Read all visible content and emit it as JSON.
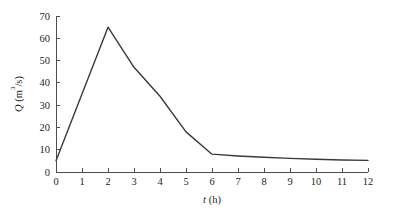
{
  "figure": {
    "background_color": "#ffffff",
    "line_color": "#3a3a3a",
    "axis_color": "#4d4d4d",
    "text_color": "#231f20"
  },
  "axes": {
    "x_title_var": "t",
    "x_title_unit": " (h)",
    "y_title_var": "Q",
    "y_title_unit_open": " (m",
    "y_title_unit_sup": "3",
    "y_title_unit_close": "/s)",
    "x_tick_labels": [
      "0",
      "1",
      "2",
      "3",
      "4",
      "5",
      "6",
      "7",
      "8",
      "9",
      "10",
      "11",
      "12"
    ],
    "y_tick_labels": [
      "0",
      "10",
      "20",
      "30",
      "40",
      "50",
      "60",
      "70"
    ]
  },
  "chart_data": {
    "type": "line",
    "title": "",
    "subtitle": "",
    "xlabel": "t (h)",
    "ylabel": "Q (m3/s)",
    "xlim": [
      0,
      12
    ],
    "ylim": [
      0,
      70
    ],
    "xticks": [
      0,
      1,
      2,
      3,
      4,
      5,
      6,
      7,
      8,
      9,
      10,
      11,
      12
    ],
    "yticks": [
      0,
      10,
      20,
      30,
      40,
      50,
      60,
      70
    ],
    "grid": false,
    "legend": false,
    "legend_position": "none",
    "annotations": [],
    "series": [
      {
        "name": "Discharge hydrograph",
        "color": "#3a3a3a",
        "x": [
          0,
          2,
          3,
          4,
          5,
          6,
          7,
          8,
          9,
          10,
          11,
          12
        ],
        "values": [
          5,
          65,
          47,
          34,
          18,
          8,
          7.2,
          6.6,
          6.1,
          5.7,
          5.4,
          5.2
        ]
      }
    ]
  }
}
